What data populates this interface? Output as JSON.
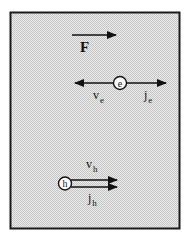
{
  "figure": {
    "background": "#d9d9d9",
    "border_color": "#1a1a1a",
    "force": {
      "label": "F"
    },
    "electron": {
      "symbol": "e",
      "velocity_label": {
        "base": "v",
        "sub": "e"
      },
      "current_label": {
        "base": "j",
        "sub": "e"
      }
    },
    "hole": {
      "symbol": "h",
      "velocity_label": {
        "base": "v",
        "sub": "h"
      },
      "current_label": {
        "base": "j",
        "sub": "h"
      }
    }
  }
}
